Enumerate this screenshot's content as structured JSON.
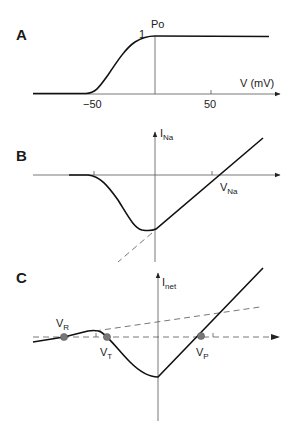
{
  "figure": {
    "panels": [
      {
        "id": "A",
        "label": "A",
        "y_label": "Po",
        "y_tick": "1",
        "x_label": "V (mV)",
        "x_ticks": [
          "−50",
          "50"
        ]
      },
      {
        "id": "B",
        "label": "B",
        "y_label_main": "I",
        "y_label_sub": "Na",
        "x_marker_main": "V",
        "x_marker_sub": "Na"
      },
      {
        "id": "C",
        "label": "C",
        "y_label_main": "I",
        "y_label_sub": "net",
        "points": [
          {
            "main": "V",
            "sub": "R"
          },
          {
            "main": "V",
            "sub": "T"
          },
          {
            "main": "V",
            "sub": "P"
          }
        ]
      }
    ]
  },
  "colors": {
    "curve": "#111111",
    "axis": "#555555",
    "dot": "#777777"
  }
}
